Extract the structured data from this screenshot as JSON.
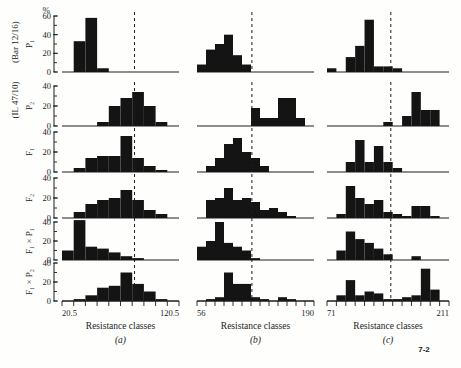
{
  "figure": {
    "number": "7-2",
    "ylabel_unit": "%",
    "row_labels": [
      "P₁",
      "P₂",
      "F₁",
      "F₂",
      "F₁ × P₁",
      "F₁ × P₂"
    ],
    "cross_label_top": "(Bar 12/16)",
    "cross_label_bottom": "(IL 47/10)",
    "xlabel": "Resistance classes"
  },
  "chart_data": {
    "type": "bar",
    "title": "",
    "xlabel": "Resistance classes",
    "ylabel": "%",
    "grid": false,
    "legend": "none",
    "panels": [
      {
        "key": "a",
        "label": "(a)",
        "xlim": [
          20.5,
          120.5
        ],
        "xtick_labels": [
          "20.5",
          "120.5"
        ],
        "n_classes": 10,
        "mean_marker_class": 6.2,
        "rows": [
          {
            "name": "P₁",
            "ylim": [
              0,
              60
            ],
            "yticks": [
              0,
              20,
              40,
              60
            ],
            "values": [
              0,
              33,
              58,
              4,
              0,
              0,
              0,
              0,
              0,
              0
            ]
          },
          {
            "name": "P₂",
            "ylim": [
              0,
              40
            ],
            "yticks": [
              0,
              20,
              40
            ],
            "values": [
              0,
              0,
              0,
              4,
              20,
              28,
              34,
              20,
              4,
              0
            ]
          },
          {
            "name": "F₁",
            "ylim": [
              0,
              40
            ],
            "yticks": [
              0,
              20,
              40
            ],
            "values": [
              0,
              4,
              14,
              16,
              16,
              36,
              14,
              6,
              2,
              0
            ]
          },
          {
            "name": "F₂",
            "ylim": [
              0,
              40
            ],
            "yticks": [
              0,
              20,
              40
            ],
            "values": [
              0,
              6,
              14,
              18,
              20,
              28,
              18,
              8,
              4,
              0
            ]
          },
          {
            "name": "F₁ × P₁",
            "ylim": [
              0,
              40
            ],
            "yticks": [
              0,
              20,
              40
            ],
            "values": [
              10,
              42,
              14,
              12,
              8,
              4,
              2,
              0,
              0,
              0
            ]
          },
          {
            "name": "F₁ × P₂",
            "ylim": [
              0,
              40
            ],
            "yticks": [
              0,
              20,
              40
            ],
            "values": [
              0,
              2,
              6,
              14,
              16,
              30,
              18,
              10,
              2,
              0
            ]
          }
        ]
      },
      {
        "key": "b",
        "label": "(b)",
        "xlim": [
          56,
          190
        ],
        "xtick_labels": [
          "56",
          "190"
        ],
        "n_classes": 13,
        "mean_marker_class": 6.1,
        "rows": [
          {
            "name": "P₁",
            "ylim": [
              0,
              60
            ],
            "yticks": [
              0,
              20,
              40,
              60
            ],
            "values": [
              8,
              24,
              30,
              40,
              18,
              8,
              0,
              0,
              0,
              0,
              0,
              0,
              0
            ]
          },
          {
            "name": "P₂",
            "ylim": [
              0,
              40
            ],
            "yticks": [
              0,
              20,
              40
            ],
            "values": [
              0,
              0,
              0,
              0,
              0,
              0,
              18,
              8,
              8,
              28,
              28,
              8,
              0
            ]
          },
          {
            "name": "F₁",
            "ylim": [
              0,
              40
            ],
            "yticks": [
              0,
              20,
              40
            ],
            "values": [
              0,
              6,
              14,
              28,
              34,
              20,
              14,
              6,
              0,
              0,
              0,
              0,
              0
            ]
          },
          {
            "name": "F₂",
            "ylim": [
              0,
              40
            ],
            "yticks": [
              0,
              20,
              40
            ],
            "values": [
              0,
              18,
              20,
              30,
              18,
              20,
              16,
              8,
              10,
              6,
              2,
              0,
              0
            ]
          },
          {
            "name": "F₁ × P₁",
            "ylim": [
              0,
              40
            ],
            "yticks": [
              0,
              20,
              40
            ],
            "values": [
              14,
              20,
              40,
              18,
              14,
              10,
              2,
              0,
              0,
              0,
              0,
              0,
              0
            ]
          },
          {
            "name": "F₁ × P₂",
            "ylim": [
              0,
              40
            ],
            "yticks": [
              0,
              20,
              40
            ],
            "values": [
              0,
              2,
              4,
              30,
              18,
              18,
              4,
              2,
              0,
              4,
              2,
              0,
              0
            ]
          }
        ]
      },
      {
        "key": "c",
        "label": "(c)",
        "xlim": [
          71,
          211
        ],
        "xtick_labels": [
          "71",
          "211"
        ],
        "n_classes": 13,
        "mean_marker_class": 6.8,
        "rows": [
          {
            "name": "P₁",
            "ylim": [
              0,
              60
            ],
            "yticks": [
              0,
              20,
              40,
              60
            ],
            "values": [
              4,
              0,
              16,
              28,
              56,
              6,
              6,
              4,
              0,
              0,
              0,
              0,
              0
            ]
          },
          {
            "name": "P₂",
            "ylim": [
              0,
              40
            ],
            "yticks": [
              0,
              20,
              40
            ],
            "values": [
              0,
              0,
              0,
              0,
              0,
              0,
              4,
              0,
              10,
              34,
              16,
              16,
              0
            ]
          },
          {
            "name": "F₁",
            "ylim": [
              0,
              40
            ],
            "yticks": [
              0,
              20,
              40
            ],
            "values": [
              0,
              0,
              10,
              32,
              10,
              26,
              10,
              4,
              0,
              0,
              0,
              0,
              0
            ]
          },
          {
            "name": "F₂",
            "ylim": [
              0,
              40
            ],
            "yticks": [
              0,
              20,
              40
            ],
            "values": [
              0,
              4,
              32,
              20,
              14,
              18,
              6,
              4,
              2,
              12,
              12,
              2,
              0
            ]
          },
          {
            "name": "F₁ × P₁",
            "ylim": [
              0,
              40
            ],
            "yticks": [
              0,
              20,
              40
            ],
            "values": [
              0,
              10,
              30,
              22,
              18,
              12,
              6,
              0,
              0,
              4,
              0,
              0,
              0
            ]
          },
          {
            "name": "F₁ × P₂",
            "ylim": [
              0,
              40
            ],
            "yticks": [
              0,
              20,
              40
            ],
            "values": [
              0,
              6,
              22,
              6,
              10,
              8,
              2,
              2,
              4,
              6,
              34,
              12,
              0
            ]
          }
        ]
      }
    ]
  }
}
